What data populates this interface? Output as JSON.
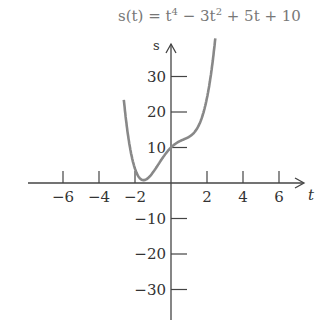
{
  "chart_data": {
    "type": "line",
    "title_parts": {
      "prefix": "s(t) = t",
      "exp1": "4",
      "mid": " − 3t",
      "exp2": "2",
      "suffix": " + 5t + 10"
    },
    "xlabel": "t",
    "ylabel": "s",
    "xlim": [
      -8,
      8
    ],
    "ylim": [
      -38,
      42
    ],
    "x_ticks": [
      -6,
      -4,
      -2,
      2,
      4,
      6
    ],
    "x_tick_labels": [
      "−6",
      "−4",
      "−2",
      "2",
      "4",
      "6"
    ],
    "y_ticks": [
      30,
      20,
      10,
      -10,
      -20,
      -30
    ],
    "y_tick_labels": [
      "30",
      "20",
      "10",
      "−10",
      "−20",
      "−30"
    ],
    "grid": false,
    "series": [
      {
        "name": "s(t)",
        "color": "#888888",
        "coefficients": {
          "t4": 1,
          "t3": 0,
          "t2": -3,
          "t1": 5,
          "t0": 10
        },
        "x": [
          -2.6,
          -2.4,
          -2.2,
          -2.0,
          -1.8,
          -1.5,
          -1.2,
          -1.0,
          -0.5,
          0,
          0.5,
          1.0,
          1.5,
          2.0,
          2.3,
          2.45
        ],
        "values": [
          39.5,
          28.5,
          19.6,
          4.0,
          1.8,
          0.8,
          2.1,
          3.0,
          6.8,
          10.0,
          11.8,
          13.0,
          15.8,
          24.0,
          32.8,
          38.0
        ]
      }
    ]
  },
  "axis_colors": {
    "axis": "#444444",
    "curve": "#888888",
    "title": "#777777"
  }
}
